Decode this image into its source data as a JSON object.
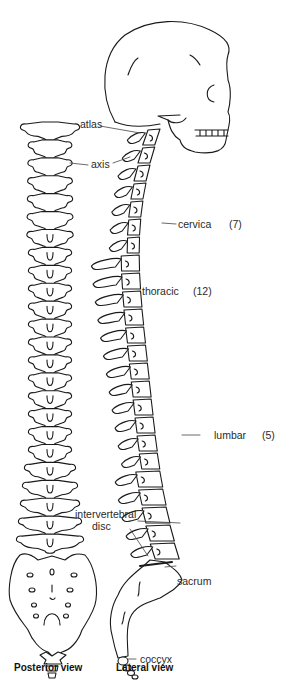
{
  "diagram": {
    "type": "anatomical line drawing",
    "views": [
      {
        "id": "posterior",
        "caption": "Posterior view"
      },
      {
        "id": "lateral",
        "caption": "Lateral view"
      }
    ]
  },
  "labels": {
    "atlas": "atlas",
    "axis": "axis",
    "cervical": "cervica",
    "cervical_count": "(7)",
    "thoracic": "thoracic",
    "thoracic_count": "(12)",
    "lumbar": "lumbar",
    "lumbar_count": "(5)",
    "intervertebral_line1": "intervertebral",
    "intervertebral_line2": "disc",
    "sacrum": "sacrum",
    "coccyx": "coccyx"
  },
  "captions": {
    "posterior": "Posterior view",
    "lateral": "Lateral view"
  },
  "colors": {
    "line": "#1a1a1a",
    "background": "#ffffff",
    "text": "#2a2a2a"
  },
  "regions": [
    {
      "name": "cervical",
      "vertebrae": 7
    },
    {
      "name": "thoracic",
      "vertebrae": 12
    },
    {
      "name": "lumbar",
      "vertebrae": 5
    }
  ]
}
